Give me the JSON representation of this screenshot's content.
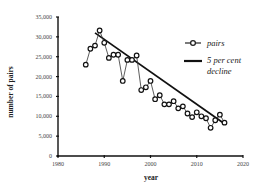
{
  "chart_data": {
    "type": "line",
    "title": "",
    "xlabel": "year",
    "ylabel": "number of pairs",
    "xlim": [
      1980,
      2020
    ],
    "ylim": [
      0,
      35000
    ],
    "xticks": [
      1980,
      1990,
      2000,
      2010,
      2020
    ],
    "xtick_labels": [
      "1980",
      "1990",
      "2000",
      "2010",
      "2020"
    ],
    "yticks": [
      0,
      5000,
      10000,
      15000,
      20000,
      25000,
      30000,
      35000
    ],
    "ytick_labels": [
      "0",
      "5,000",
      "10,000",
      "15,000",
      "20,000",
      "25,000",
      "30,000",
      "35,000"
    ],
    "grid": false,
    "legend_position": "right",
    "series": [
      {
        "name": "pairs",
        "style": "line-with-open-circle-markers",
        "x": [
          1986,
          1987,
          1988,
          1989,
          1990,
          1991,
          1992,
          1993,
          1994,
          1995,
          1996,
          1997,
          1998,
          1999,
          2000,
          2001,
          2002,
          2003,
          2004,
          2005,
          2006,
          2007,
          2008,
          2009,
          2010,
          2011,
          2012,
          2013,
          2014,
          2015,
          2016
        ],
        "values": [
          23000,
          27000,
          27800,
          31600,
          28500,
          24700,
          25500,
          25500,
          18900,
          24200,
          24200,
          25300,
          16600,
          17300,
          18900,
          14300,
          15300,
          13000,
          13000,
          13800,
          12000,
          12500,
          10700,
          9800,
          11000,
          10000,
          9500,
          7100,
          9000,
          10400,
          8400
        ]
      },
      {
        "name": "5 per cent decline",
        "style": "solid-line",
        "x": [
          1988,
          2016
        ],
        "values": [
          31000,
          8100
        ]
      }
    ]
  },
  "legend": {
    "items": [
      {
        "label": "pairs",
        "icon": "line-circle-marker-icon"
      },
      {
        "label_line1": "5 per cent",
        "label_line2": "decline",
        "icon": "solid-line-icon"
      }
    ]
  },
  "axes": {
    "x_title": "year",
    "y_title": "number of pairs"
  }
}
